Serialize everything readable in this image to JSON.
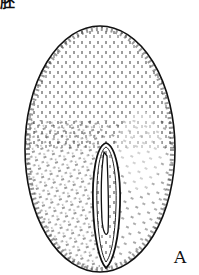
{
  "heading": {
    "text": "胚"
  },
  "figure": {
    "panel_label": "A",
    "colors": {
      "ink": "#111111",
      "background": "#ffffff"
    }
  }
}
